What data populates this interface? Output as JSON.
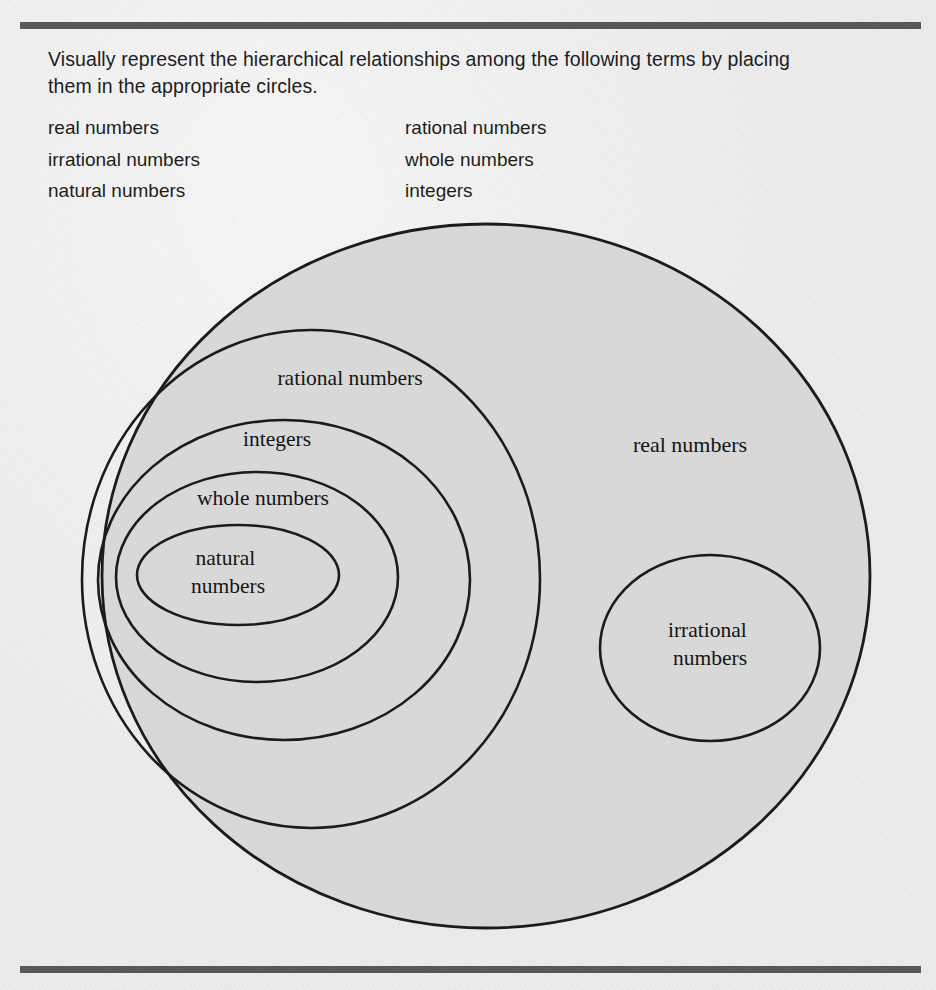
{
  "page": {
    "background_color": "#ececec",
    "rule_color": "#58585a",
    "shaded_fill": "#d8d8d8",
    "stroke_color": "#1b1b1b"
  },
  "prompt": {
    "text": "Visually represent the hierarchical relationships among the following terms by placing them in the appropriate circles."
  },
  "terms": {
    "left_column": [
      "real numbers",
      "irrational numbers",
      "natural numbers"
    ],
    "right_column": [
      "rational numbers",
      "whole numbers",
      "integers"
    ]
  },
  "diagram": {
    "type": "nested-set-venn",
    "regions": [
      {
        "name": "real-numbers",
        "label": "real numbers",
        "shape": "ellipse",
        "cx": 486,
        "cy": 576,
        "rx": 384,
        "ry": 352,
        "label_x": 690,
        "label_y": 452,
        "filled": true,
        "contains": [
          "rational-numbers",
          "irrational-numbers"
        ]
      },
      {
        "name": "rational-numbers",
        "label": "rational numbers",
        "shape": "ellipse",
        "cx": 311,
        "cy": 579,
        "rx": 229,
        "ry": 249,
        "label_x": 350,
        "label_y": 385,
        "filled": false,
        "contains": [
          "integers"
        ]
      },
      {
        "name": "integers",
        "label": "integers",
        "shape": "ellipse",
        "cx": 284,
        "cy": 580,
        "rx": 186,
        "ry": 160,
        "label_x": 277,
        "label_y": 446,
        "filled": false,
        "contains": [
          "whole-numbers"
        ]
      },
      {
        "name": "whole-numbers",
        "label": "whole numbers",
        "shape": "ellipse",
        "cx": 257,
        "cy": 577,
        "rx": 141,
        "ry": 105,
        "label_x": 263,
        "label_y": 505,
        "filled": false,
        "contains": [
          "natural-numbers"
        ]
      },
      {
        "name": "natural-numbers",
        "label_line1": "natural",
        "label_line2": "numbers",
        "shape": "ellipse",
        "cx": 238,
        "cy": 575,
        "rx": 101,
        "ry": 50,
        "label_x": 228,
        "label_y": 565,
        "filled": false,
        "contains": []
      },
      {
        "name": "irrational-numbers",
        "label_line1": "irrational",
        "label_line2": "numbers",
        "shape": "ellipse",
        "cx": 710,
        "cy": 648,
        "rx": 110,
        "ry": 93,
        "label_x": 710,
        "label_y": 637,
        "filled": false,
        "contains": []
      }
    ]
  }
}
